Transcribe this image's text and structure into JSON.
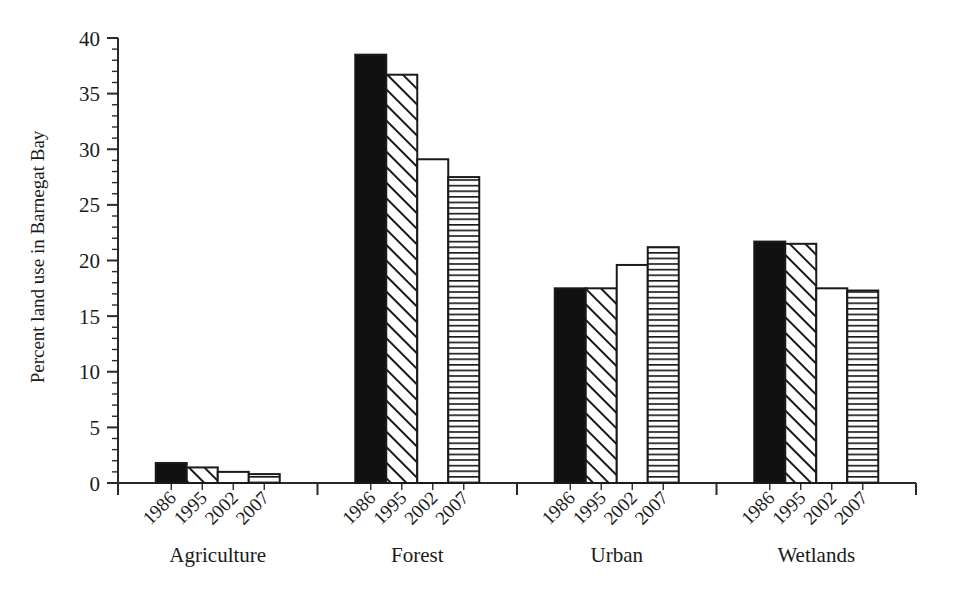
{
  "chart_data": {
    "type": "bar",
    "title": "",
    "subtitle": "",
    "xlabel": "",
    "ylabel": "Percent land use in Barnegat Bay",
    "ylim": [
      0,
      40
    ],
    "ytick_values": [
      0,
      5,
      10,
      15,
      20,
      25,
      30,
      35,
      40
    ],
    "ytick_labels": [
      "0",
      "5",
      "10",
      "15",
      "20",
      "25",
      "30",
      "35",
      "40"
    ],
    "y_minor_tick_interval": 1,
    "grid": false,
    "legend_position": "none",
    "legend_entries": [],
    "annotations": [],
    "categories": [
      "Agriculture",
      "Forest",
      "Urban",
      "Wetlands"
    ],
    "series_key": "year",
    "series": [
      {
        "name": "1986",
        "pattern": "solid-black",
        "values": [
          1.8,
          38.5,
          17.5,
          21.7
        ]
      },
      {
        "name": "1995",
        "pattern": "diagonal-hatch",
        "values": [
          1.4,
          36.7,
          17.5,
          21.5
        ]
      },
      {
        "name": "2002",
        "pattern": "blank-white",
        "values": [
          1.0,
          29.1,
          19.6,
          17.5
        ]
      },
      {
        "name": "2007",
        "pattern": "horizontal-hatch",
        "values": [
          0.8,
          27.5,
          21.2,
          17.3
        ]
      }
    ],
    "group_year_tick_labels": [
      [
        "1986",
        "1995",
        "2002",
        "2007"
      ],
      [
        "1986",
        "1995",
        "2002",
        "2007"
      ],
      [
        "1986",
        "1995",
        "2002",
        "2007"
      ],
      [
        "1986",
        "1995",
        "2002",
        "2007"
      ]
    ]
  },
  "colors": {
    "axis": "#2a2a2a",
    "bar_outline": "#1a1a1a",
    "bar_solid_fill": "#111111",
    "bar_blank_fill": "#ffffff",
    "hatch_stroke": "#1a1a1a",
    "background": "#ffffff",
    "text": "#1a1a1a"
  }
}
